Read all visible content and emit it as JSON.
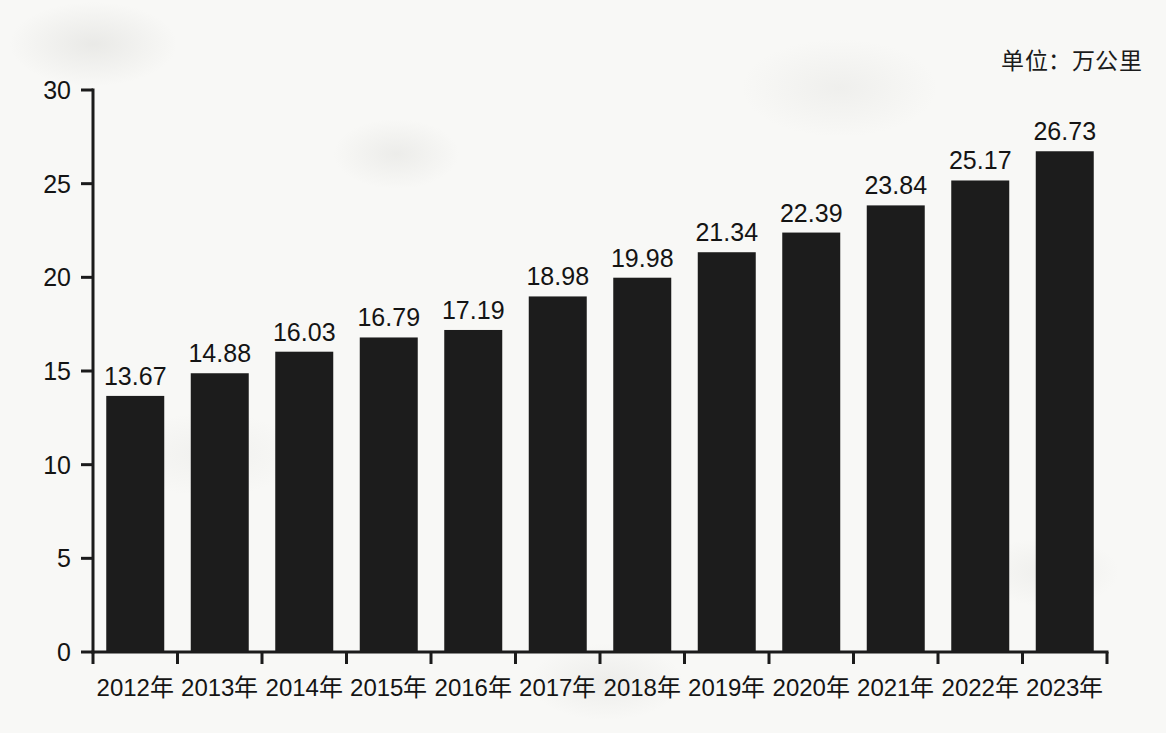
{
  "unit_note": "单位：万公里",
  "chart_data": {
    "type": "bar",
    "title": "",
    "xlabel": "",
    "ylabel": "",
    "unit": "万公里",
    "categories": [
      "2012年",
      "2013年",
      "2014年",
      "2015年",
      "2016年",
      "2017年",
      "2018年",
      "2019年",
      "2020年",
      "2021年",
      "2022年",
      "2023年"
    ],
    "values": [
      13.67,
      14.88,
      16.03,
      16.79,
      17.19,
      18.98,
      19.98,
      21.34,
      22.39,
      23.84,
      25.17,
      26.73
    ],
    "value_labels": [
      "13.67",
      "14.88",
      "16.03",
      "16.79",
      "17.19",
      "18.98",
      "19.98",
      "21.34",
      "22.39",
      "23.84",
      "25.17",
      "26.73"
    ],
    "ylim": [
      0,
      30
    ],
    "yticks": [
      0,
      5,
      10,
      15,
      20,
      25,
      30
    ],
    "ytick_labels": [
      "0",
      "5",
      "10",
      "15",
      "20",
      "25",
      "30"
    ],
    "grid": false,
    "legend": null,
    "bar_color": "#1c1c1c",
    "background_color": "#f8f8f6",
    "axis_color": "#1b1b1b",
    "text_color": "#141414"
  },
  "geometry": {
    "plot_left": 93,
    "plot_right": 1107,
    "plot_top": 90,
    "plot_bottom": 652,
    "bar_width": 58,
    "tick_len_y": 12,
    "tick_len_x": 12,
    "value_label_offset": 11,
    "xtick_label_offset": 30
  }
}
